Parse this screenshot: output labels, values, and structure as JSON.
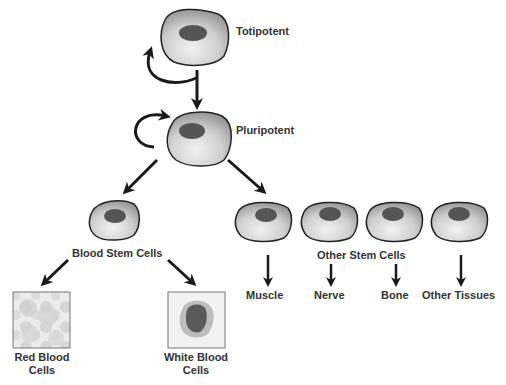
{
  "diagram": {
    "type": "stem-cell-differentiation",
    "colors": {
      "cell_fill_light": "#e8e8e8",
      "cell_fill_dark": "#9a9a9a",
      "nucleus": "#555555",
      "outline": "#222222",
      "arrow": "#1a1a1a",
      "text": "#333333"
    },
    "nodes": {
      "totipotent": {
        "label": "Totipotent"
      },
      "pluripotent": {
        "label": "Pluripotent"
      },
      "blood_stem": {
        "label": "Blood Stem Cells"
      },
      "other_stem": {
        "label": "Other Stem Cells"
      }
    },
    "blood_outputs": [
      {
        "label_line1": "Red Blood",
        "label_line2": "Cells"
      },
      {
        "label_line1": "White Blood",
        "label_line2": "Cells"
      }
    ],
    "tissue_outputs": [
      {
        "label": "Muscle"
      },
      {
        "label": "Nerve"
      },
      {
        "label": "Bone"
      },
      {
        "label": "Other Tissues"
      }
    ]
  }
}
